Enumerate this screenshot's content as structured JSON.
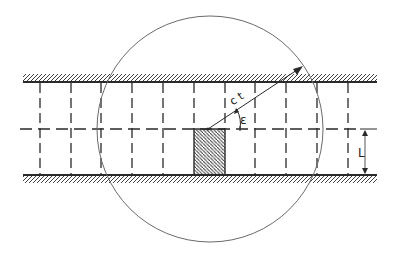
{
  "diagram": {
    "title": "",
    "colors": {
      "ink": "#2a2a2a",
      "circle": "#6a6a6a",
      "background": "#ffffff"
    },
    "channel": {
      "x_start": 23,
      "x_end": 377,
      "top_wall_y": 82,
      "bottom_wall_y": 175,
      "centerline_y": 129
    },
    "vertical_lines_x": [
      40,
      71,
      101,
      132,
      163,
      194,
      225,
      255,
      286,
      317,
      348
    ],
    "circle": {
      "cx": 210,
      "cy": 129,
      "r": 113
    },
    "radius_arrow": {
      "from": [
        208,
        129
      ],
      "to": [
        303,
        66
      ],
      "label": "c t"
    },
    "angle": {
      "label": "ε"
    },
    "shaded_cell": {
      "x": 194,
      "y": 129,
      "w": 31,
      "h": 46
    },
    "dimension": {
      "label": "L",
      "x": 365,
      "from_y": 129,
      "to_y": 175
    }
  }
}
